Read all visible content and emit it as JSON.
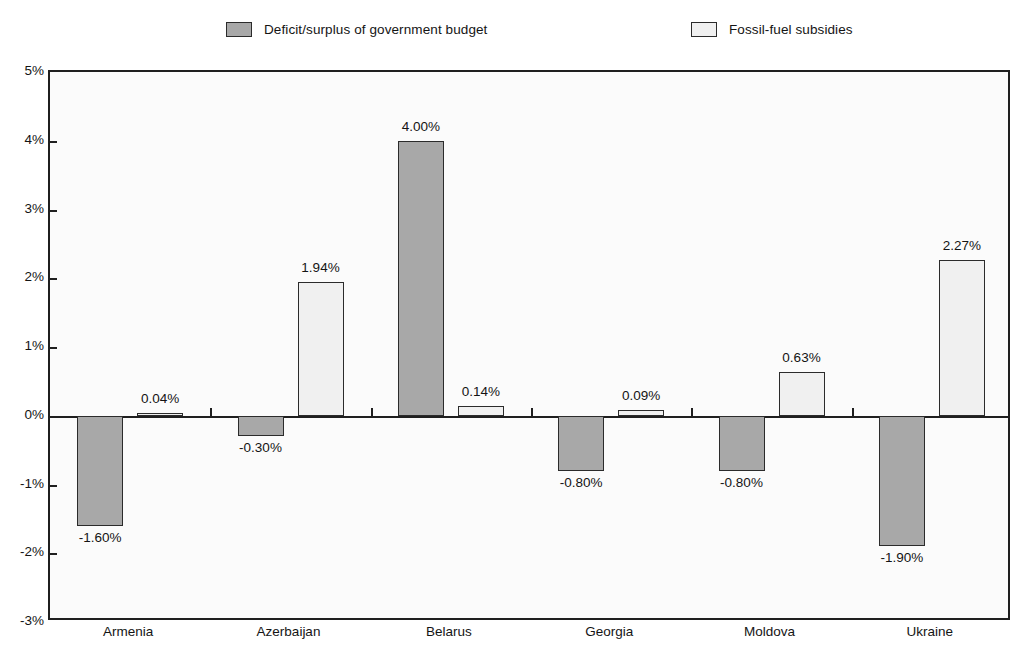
{
  "legend": {
    "entries": [
      {
        "label": "Deficit/surplus of government budget",
        "color": "#a8a8a8"
      },
      {
        "label": "Fossil-fuel subsidies",
        "color": "#f0f0f0"
      }
    ]
  },
  "axis": {
    "y_ticks": [
      "5%",
      "4%",
      "3%",
      "2%",
      "1%",
      "0%",
      "-1%",
      "-2%",
      "-3%"
    ],
    "x_ticks": [
      "Armenia",
      "Azerbaijan",
      "Belarus",
      "Georgia",
      "Moldova",
      "Ukraine"
    ]
  },
  "bar_labels": {
    "armenia_deficit": "-1.60%",
    "armenia_subsidies": "0.04%",
    "azerbaijan_deficit": "-0.30%",
    "azerbaijan_subsidies": "1.94%",
    "belarus_deficit": "4.00%",
    "belarus_subsidies": "0.14%",
    "georgia_deficit": "-0.80%",
    "georgia_subsidies": "0.09%",
    "moldova_deficit": "-0.80%",
    "moldova_subsidies": "0.63%",
    "ukraine_deficit": "-1.90%",
    "ukraine_subsidies": "2.27%"
  },
  "chart_data": {
    "type": "bar",
    "title": "",
    "xlabel": "",
    "ylabel": "",
    "ylim": [
      -3,
      5
    ],
    "ytick_step": 1,
    "ytick_format": "percent",
    "grid": false,
    "legend_position": "top",
    "categories": [
      "Armenia",
      "Azerbaijan",
      "Belarus",
      "Georgia",
      "Moldova",
      "Ukraine"
    ],
    "series": [
      {
        "name": "Deficit/surplus of government budget",
        "color": "#a8a8a8",
        "values": [
          -1.6,
          -0.3,
          4.0,
          -0.8,
          -0.8,
          -1.9
        ],
        "labels": [
          "-1.60%",
          "-0.30%",
          "4.00%",
          "-0.80%",
          "-0.80%",
          "-1.90%"
        ]
      },
      {
        "name": "Fossil-fuel subsidies",
        "color": "#f0f0f0",
        "values": [
          0.04,
          1.94,
          0.14,
          0.09,
          0.63,
          2.27
        ],
        "labels": [
          "0.04%",
          "1.94%",
          "0.14%",
          "0.09%",
          "0.63%",
          "2.27%"
        ]
      }
    ]
  }
}
